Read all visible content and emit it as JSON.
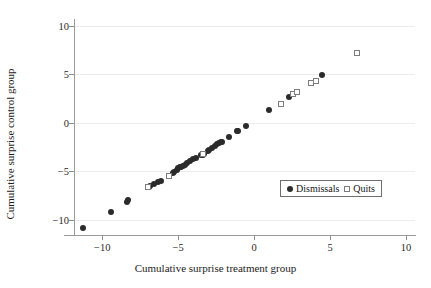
{
  "chart_data": {
    "type": "scatter",
    "title": "",
    "xlabel": "Cumulative surprise treatment group",
    "ylabel": "Cumulative surprise control group",
    "xlim": [
      -11.8,
      10.6
    ],
    "ylim": [
      -11.6,
      10.6
    ],
    "xticks": [
      -10,
      -5,
      0,
      5,
      10
    ],
    "yticks": [
      -10,
      -5,
      0,
      5,
      10
    ],
    "xticklabels": [
      "-10",
      "-5",
      "0",
      "5",
      "10"
    ],
    "yticklabels": [
      "-10",
      "-5",
      "0",
      "5",
      "10"
    ],
    "grid": "horizontal",
    "gridlines_y": [
      10,
      5,
      0,
      -5,
      -10
    ],
    "legend_position": "lower-right",
    "colors": {
      "dismissals_marker": "#2b2b2b",
      "quits_marker_edge": "#7d7d7d",
      "gridline": "#ececed",
      "axis": "#9a9a9a",
      "legend_border": "#6e6e6e",
      "background": "#ffffff"
    },
    "series": [
      {
        "name": "Dismissals",
        "marker": "filled-circle",
        "points": [
          [
            -11.3,
            -10.9
          ],
          [
            -9.4,
            -9.25
          ],
          [
            -8.35,
            -8.15
          ],
          [
            -8.3,
            -7.95
          ],
          [
            -6.95,
            -6.6
          ],
          [
            -6.85,
            -6.5
          ],
          [
            -6.6,
            -6.35
          ],
          [
            -6.35,
            -6.15
          ],
          [
            -6.15,
            -6.0
          ],
          [
            -5.6,
            -5.55
          ],
          [
            -5.35,
            -5.2
          ],
          [
            -5.25,
            -5.05
          ],
          [
            -5.1,
            -4.85
          ],
          [
            -5.0,
            -4.7
          ],
          [
            -4.9,
            -4.6
          ],
          [
            -4.8,
            -4.55
          ],
          [
            -4.7,
            -4.5
          ],
          [
            -4.55,
            -4.4
          ],
          [
            -4.4,
            -4.15
          ],
          [
            -4.2,
            -3.95
          ],
          [
            -4.0,
            -3.8
          ],
          [
            -3.8,
            -3.65
          ],
          [
            -3.5,
            -3.35
          ],
          [
            -3.4,
            -3.3
          ],
          [
            -3.3,
            -3.2
          ],
          [
            -3.05,
            -2.95
          ],
          [
            -2.95,
            -2.85
          ],
          [
            -2.75,
            -2.6
          ],
          [
            -2.6,
            -2.4
          ],
          [
            -2.45,
            -2.25
          ],
          [
            -2.3,
            -2.1
          ],
          [
            -2.2,
            -2.0
          ],
          [
            -2.1,
            -1.95
          ],
          [
            -1.65,
            -1.5
          ],
          [
            -1.15,
            -0.9
          ],
          [
            -1.05,
            -0.85
          ],
          [
            -0.55,
            -0.3
          ],
          [
            0.95,
            1.3
          ],
          [
            2.3,
            2.6
          ],
          [
            4.5,
            4.9
          ]
        ]
      },
      {
        "name": "Quits",
        "marker": "open-square",
        "points": [
          [
            -7.0,
            -6.65
          ],
          [
            -5.6,
            -5.5
          ],
          [
            -3.4,
            -3.25
          ],
          [
            1.75,
            1.9
          ],
          [
            2.55,
            2.95
          ],
          [
            2.85,
            3.15
          ],
          [
            3.75,
            4.05
          ],
          [
            4.05,
            4.35
          ],
          [
            6.8,
            7.2
          ]
        ]
      }
    ]
  },
  "legend": {
    "entries": [
      {
        "label": "Dismissals",
        "marker": "filled-circle"
      },
      {
        "label": "Quits",
        "marker": "open-square"
      }
    ]
  }
}
